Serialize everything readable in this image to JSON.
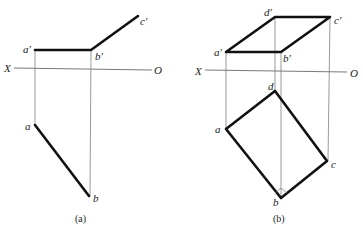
{
  "figure_a": {
    "caption": "(a)",
    "axis_labels": {
      "left": "X",
      "right": "O"
    },
    "front_view_labels": {
      "a": "a′",
      "b": "b′",
      "c": "c′"
    },
    "top_view_labels": {
      "a": "a",
      "b": "b"
    }
  },
  "figure_b": {
    "caption": "(b)",
    "axis_labels": {
      "left": "X",
      "right": "O"
    },
    "front_view_labels": {
      "a": "a′",
      "b": "b′",
      "c": "c′",
      "d": "d′"
    },
    "top_view_labels": {
      "a": "a",
      "b": "b",
      "c": "c",
      "d": "d"
    },
    "right_angle_marker_at": "b"
  }
}
